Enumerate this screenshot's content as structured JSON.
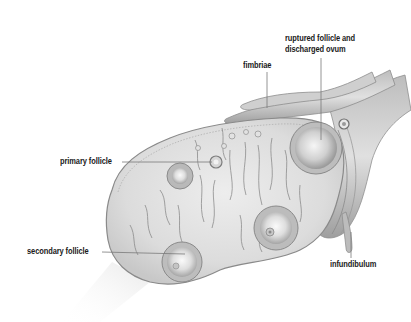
{
  "diagram": {
    "colors": {
      "background": "#ffffff",
      "tissue_fill": "#d9d9d9",
      "tissue_light": "#ececec",
      "outline": "#8a8a8a",
      "leader_line": "#7a7a7a",
      "label_text": "#1a1a1a"
    },
    "labels": {
      "ruptured_line1": "ruptured follicle and",
      "ruptured_line2": "discharged ovum",
      "fimbriae": "fimbriae",
      "primary_follicle": "primary follicle",
      "secondary_follicle": "secondary follicle",
      "infundibulum": "infundibulum"
    }
  }
}
